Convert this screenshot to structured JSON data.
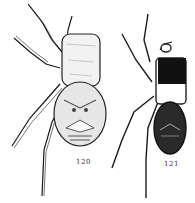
{
  "figures": [
    {
      "label": "120",
      "description": "spider illustration, light pale cephalothorax, patterned abdomen"
    },
    {
      "label": "121",
      "description": "spider illustration, dark cephalothorax, dark patterned abdomen"
    }
  ],
  "colors": {
    "ink": "#1a1a1a",
    "paper": "#ffffff",
    "shade": "#555555"
  }
}
